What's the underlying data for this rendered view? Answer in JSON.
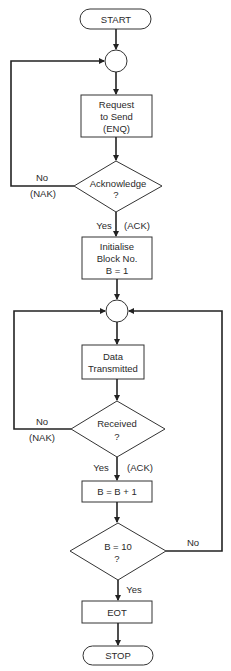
{
  "diagram": {
    "type": "flowchart",
    "nodes": {
      "start": {
        "label": "START"
      },
      "request": {
        "lines": [
          "Request",
          "to Send",
          "(ENQ)"
        ]
      },
      "acknowledge": {
        "lines": [
          "Acknowledge",
          "?"
        ]
      },
      "initialise": {
        "lines": [
          "Initialise",
          "Block No.",
          "B = 1"
        ]
      },
      "data": {
        "lines": [
          "Data",
          "Transmitted"
        ]
      },
      "received": {
        "lines": [
          "Received",
          "?"
        ]
      },
      "increment": {
        "label": "B = B + 1"
      },
      "check": {
        "lines": [
          "B = 10",
          "?"
        ]
      },
      "eot": {
        "label": "EOT"
      },
      "stop": {
        "label": "STOP"
      }
    },
    "edge_labels": {
      "ack_no": "No",
      "ack_nak": "(NAK)",
      "ack_yes": "Yes",
      "ack_ack": "(ACK)",
      "recv_no": "No",
      "recv_nak": "(NAK)",
      "recv_yes": "Yes",
      "recv_ack": "(ACK)",
      "check_no": "No",
      "check_yes": "Yes"
    }
  }
}
